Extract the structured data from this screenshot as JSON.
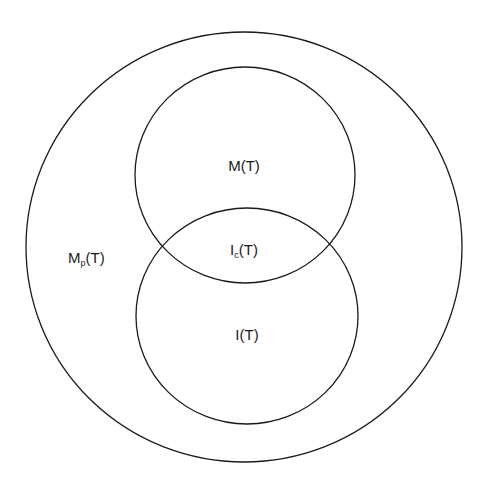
{
  "diagram": {
    "type": "venn",
    "background": "#ffffff",
    "stroke_color": "#1a1a1a",
    "sets": [
      {
        "id": "outer",
        "label_base": "M",
        "label_sub": "p",
        "label_tail": "(T)",
        "label_full": "Mp(T)",
        "cx": 244,
        "cy": 247,
        "rx": 218,
        "ry": 215,
        "label_x": 68,
        "label_y": 263
      },
      {
        "id": "upper",
        "label_base": "M",
        "label_sub": "",
        "label_tail": "(T)",
        "label_full": "M(T)",
        "cx": 245,
        "cy": 175,
        "rx": 110,
        "ry": 108,
        "label_x": 244,
        "label_y": 171
      },
      {
        "id": "lower",
        "label_base": "I",
        "label_sub": "",
        "label_tail": "(T)",
        "label_full": "I(T)",
        "cx": 247,
        "cy": 316,
        "rx": 111,
        "ry": 108,
        "label_x": 247,
        "label_y": 340
      }
    ],
    "intersection": {
      "label_base": "I",
      "label_sub": "c",
      "label_tail": "(T)",
      "label_full": "Ic(T)",
      "label_x": 244,
      "label_y": 255
    }
  }
}
